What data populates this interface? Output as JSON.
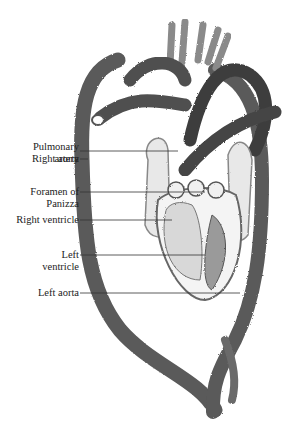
{
  "figure": {
    "labels": [
      {
        "id": "pulmonary-artery",
        "lines": [
          "Pulmonary",
          "artery"
        ],
        "line_y": 151
      },
      {
        "id": "right-aorta",
        "lines": [
          "Right aorta"
        ],
        "line_y": 159
      },
      {
        "id": "foramen-of-panizza",
        "lines": [
          "Foramen of",
          "Panizza"
        ],
        "line_y": 192
      },
      {
        "id": "right-ventricle",
        "lines": [
          "Right ventricle"
        ],
        "line_y": 220
      },
      {
        "id": "left-ventricle",
        "lines": [
          "Left",
          "ventricle"
        ],
        "line_y": 255
      },
      {
        "id": "left-aorta",
        "lines": [
          "Left aorta"
        ],
        "line_y": 293
      }
    ]
  },
  "colors": {
    "vessel": "#555555",
    "vessel_light": "#9a9a9a",
    "outline": "#444444",
    "label": "#222222",
    "background": "#ffffff"
  }
}
